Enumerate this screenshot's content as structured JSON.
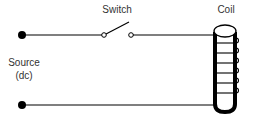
{
  "diagram": {
    "labels": {
      "switch": "Switch",
      "coil": "Coil",
      "source_line1": "Source",
      "source_line2": "(dc)"
    },
    "components": [
      {
        "id": "source",
        "type": "dc-source-terminals",
        "label": "Source (dc)"
      },
      {
        "id": "switch",
        "type": "spst-switch",
        "state": "open",
        "label": "Switch"
      },
      {
        "id": "coil",
        "type": "solenoid-coil",
        "turns": 6,
        "label": "Coil"
      }
    ],
    "colors": {
      "stroke": "#000000",
      "text": "#333333",
      "background": "#ffffff"
    }
  }
}
